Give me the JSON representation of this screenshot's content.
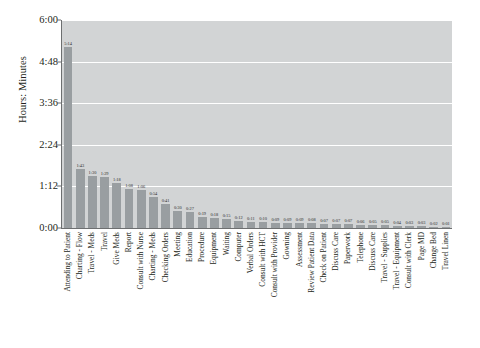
{
  "chart_data": {
    "type": "bar",
    "title": "",
    "xlabel": "",
    "ylabel": "Hours: Minutes",
    "ylim": [
      0,
      360
    ],
    "y_unit": "minutes",
    "grid": true,
    "legend": "none",
    "y_ticks": [
      {
        "label": "6:00",
        "minutes": 360
      },
      {
        "label": "4:48",
        "minutes": 288
      },
      {
        "label": "3:36",
        "minutes": 216
      },
      {
        "label": "2:24",
        "minutes": 144
      },
      {
        "label": "1:12",
        "minutes": 72
      },
      {
        "label": "0:00",
        "minutes": 0
      }
    ],
    "categories": [
      "Attending to Patient",
      "Charting - Flow",
      "Travel - Meds",
      "Travel",
      "Give Meds",
      "Report",
      "Consult with Nurse",
      "Charting - Meds",
      "Checking Orders",
      "Meeting",
      "Education",
      "Procedure",
      "Equipment",
      "Waiting",
      "Computer",
      "Verbal Orders",
      "Consult with HCT",
      "Consult with Provider",
      "Gowning",
      "Assessment",
      "Review Patient Data",
      "Check on Patient",
      "Discuss Care",
      "Paperwork",
      "Telephone",
      "Discuss Care",
      "Travel - Supplies",
      "Travel - Equipment",
      "Consult with Clerk",
      "Page MD",
      "Change Bed",
      "Travel Linen"
    ],
    "value_labels": [
      "5:14",
      "1:43",
      "1:30",
      "1:29",
      "1:18",
      "1:08",
      "1:06",
      "0:54",
      "0:41",
      "0:30",
      "0:27",
      "0:19",
      "0:18",
      "0:15",
      "0:12",
      "0:11",
      "0:10",
      "0:09",
      "0:09",
      "0:09",
      "0:08",
      "0:07",
      "0:07",
      "0:07",
      "0:06",
      "0:05",
      "0:05",
      "0:04",
      "0:03",
      "0:03",
      "0:02",
      "0:01"
    ],
    "values": [
      314,
      103,
      90,
      89,
      78,
      68,
      66,
      54,
      41,
      30,
      27,
      19,
      18,
      15,
      12,
      11,
      10,
      9,
      9,
      9,
      8,
      7,
      7,
      7,
      6,
      5,
      5,
      4,
      3,
      3,
      2,
      1
    ]
  },
  "style": {
    "plot_background": "#d2d4d5",
    "bar_color": "#999ea1",
    "gridline_color": "#ffffff",
    "axis_color": "#6d6f70",
    "text_color": "#231f20",
    "page_background": "#ffffff"
  }
}
